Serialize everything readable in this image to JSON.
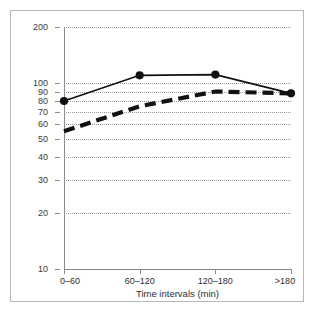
{
  "chart_data": {
    "type": "line",
    "title": "",
    "xlabel": "Time intervals (min)",
    "ylabel": "Log(PVC)",
    "categories": [
      "0–60",
      "60–120",
      "120–180",
      ">180"
    ],
    "yscale": "log",
    "ylim": [
      10,
      200
    ],
    "yticks": [
      200,
      100,
      90,
      80,
      70,
      60,
      50,
      40,
      30,
      20,
      10
    ],
    "ytick_labels": [
      "200",
      "100",
      "90",
      "80",
      "70",
      "60",
      "50",
      "40",
      "30",
      "20",
      "10"
    ],
    "grid": true,
    "grid_style": "dotted",
    "legend": "none",
    "series": [
      {
        "name": "solid-line-series",
        "style": "solid",
        "markers": "filled-circle",
        "color": "#111111",
        "values": [
          80,
          110,
          111,
          88
        ]
      },
      {
        "name": "dashed-line-series",
        "style": "thick-dashed",
        "markers": "none",
        "color": "#111111",
        "values": [
          55,
          75,
          90,
          88
        ]
      }
    ]
  },
  "axes": {
    "x_tick_labels": [
      "0–60",
      "60–120",
      "120–180",
      ">180"
    ],
    "y_tick_labels": [
      "200",
      "100",
      "90",
      "80",
      "70",
      "60",
      "50",
      "40",
      "30",
      "20",
      "10"
    ],
    "x_axis_title": "Time intervals (min)",
    "y_axis_title": "Log(PVC)"
  },
  "colors": {
    "line": "#111111",
    "grid": "#9a9a9a",
    "axis": "#8a8a8a",
    "frame": "#b9b9b9",
    "background": "#ffffff"
  }
}
